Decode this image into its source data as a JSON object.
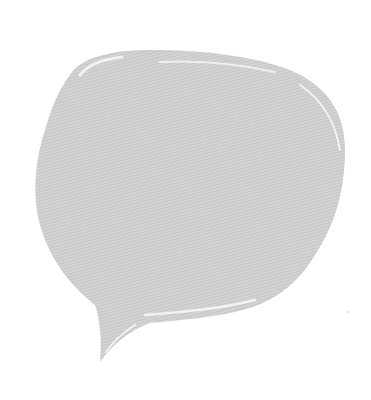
{
  "graphic": {
    "type": "speech-bubble",
    "fill_color": "#d2d2d2",
    "stripe_color": "#c4c4c4",
    "highlight_color": "#f4f4f4",
    "background_color": "#ffffff"
  }
}
